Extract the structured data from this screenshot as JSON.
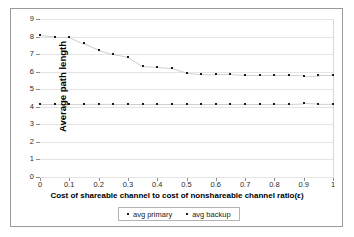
{
  "figure": {
    "background_color": "#ffffff",
    "frame_color": "#9a9a9a",
    "marker_color": "#1a1a1a",
    "gridline_color": "#e4e4e4"
  },
  "chart_data": {
    "type": "scatter",
    "title": "",
    "subtitle": "",
    "xlabel": "Cost of shareable channel to cost of nonshareable channel ratio(ε)",
    "ylabel": "Average path length",
    "xlim": [
      0,
      1
    ],
    "ylim": [
      0,
      9
    ],
    "x_ticks": [
      "0",
      "0.1",
      "0.2",
      "0.3",
      "0.4",
      "0.5",
      "0.6",
      "0.7",
      "0.8",
      "0.9",
      "1"
    ],
    "x_tick_values": [
      0,
      0.1,
      0.2,
      0.3,
      0.4,
      0.5,
      0.6,
      0.7,
      0.8,
      0.9,
      1
    ],
    "y_ticks": [
      "0",
      "1",
      "2",
      "3",
      "4",
      "5",
      "6",
      "7",
      "8",
      "9"
    ],
    "y_tick_values": [
      0,
      1,
      2,
      3,
      4,
      5,
      6,
      7,
      8,
      9
    ],
    "grid": true,
    "grid_axis": "y",
    "legend_position": "bottom",
    "x": [
      0,
      0.05,
      0.1,
      0.15,
      0.2,
      0.25,
      0.3,
      0.35,
      0.4,
      0.45,
      0.5,
      0.55,
      0.6,
      0.65,
      0.7,
      0.75,
      0.8,
      0.85,
      0.9,
      0.95,
      1
    ],
    "series": [
      {
        "name": "avg primary",
        "marker": "dot",
        "values": [
          8.08,
          8.0,
          8.0,
          7.62,
          7.25,
          7.0,
          6.85,
          6.33,
          6.28,
          6.22,
          5.95,
          5.88,
          5.85,
          5.85,
          5.8,
          5.8,
          5.8,
          5.8,
          5.78,
          5.8,
          5.8
        ]
      },
      {
        "name": "avg backup",
        "marker": "dot",
        "values": [
          4.15,
          4.15,
          4.15,
          4.13,
          4.15,
          4.17,
          4.17,
          4.17,
          4.17,
          4.17,
          4.17,
          4.17,
          4.17,
          4.17,
          4.17,
          4.17,
          4.17,
          4.17,
          4.2,
          4.17,
          4.18
        ]
      }
    ]
  },
  "legend": {
    "entries": [
      {
        "label": "avg primary"
      },
      {
        "label": "avg backup"
      }
    ]
  }
}
